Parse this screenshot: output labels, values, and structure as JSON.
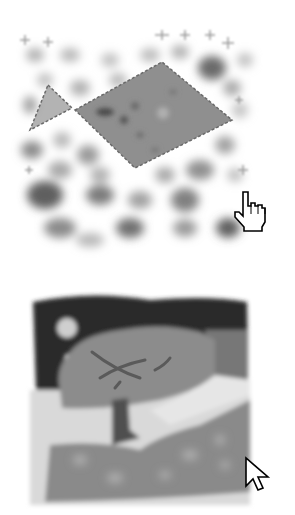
{
  "figure": {
    "top_panel": {
      "description": "blurred blob map with polygon selection",
      "colors": {
        "background": "#ffffff",
        "blob_light": "#c8c8c8",
        "blob_mid": "#9a9a9a",
        "blob_dark": "#5e5e5e",
        "selection_fill": "#8f8f8f",
        "selection_stroke": "#6a6a6a"
      },
      "cursor": "hand-pointer-icon"
    },
    "bottom_panel": {
      "description": "painted tree landscape",
      "colors": {
        "sky_dark": "#2a2a2a",
        "moon": "#cfcfcf",
        "foliage": "#8c8c8c",
        "branches": "#5a5a5a",
        "trunk": "#4f4f4f",
        "ground_light": "#d9d9d9",
        "field": "#8a8a8a",
        "right_band": "#777777"
      },
      "cursor": "arrow-pointer-icon"
    }
  }
}
